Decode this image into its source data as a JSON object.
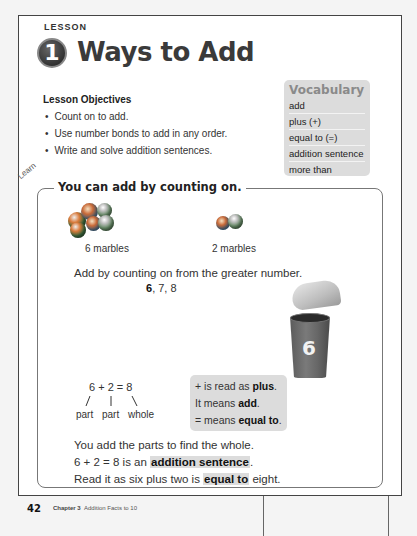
{
  "lesson": {
    "label": "LESSON",
    "number": "1",
    "title": "Ways to Add"
  },
  "objectives": {
    "heading": "Lesson Objectives",
    "items": [
      "Count on to add.",
      "Use number bonds to add in any order.",
      "Write and solve addition sentences."
    ]
  },
  "vocabulary": {
    "title": "Vocabulary",
    "items": [
      "add",
      "plus (+)",
      "equal to (=)",
      "addition sentence",
      "more than"
    ]
  },
  "learn": {
    "label": "Learn",
    "heading": "You can add by counting on.",
    "group1_caption": "6 marbles",
    "group2_caption": "2 marbles",
    "instruction": "Add by counting on from the greater number.",
    "count_start": "6",
    "count_rest": ", 7, 8",
    "cup_number": "6",
    "equation": "6 + 2 = 8",
    "bond_labels": [
      "part",
      "part",
      "whole"
    ],
    "info": {
      "line1_pre": "+ is read as ",
      "line1_bold": "plus",
      "line1_post": ".",
      "line2_pre": "It means ",
      "line2_bold": "add",
      "line2_post": ".",
      "line3_pre": "= means ",
      "line3_bold": "equal to",
      "line3_post": "."
    },
    "summary": {
      "line1": "You add the parts to find the whole.",
      "line2_pre": "6 + 2 = 8 is an ",
      "line2_bold": "addition sentence",
      "line2_post": ".",
      "line3_pre": "Read it as six plus two is ",
      "line3_bold": "equal to",
      "line3_post": " eight."
    }
  },
  "footer": {
    "page_number": "42",
    "chapter": "Chapter 3",
    "chapter_title": "Addition Facts to 10"
  },
  "colors": {
    "highlight": "#dcdcdc",
    "border": "#777777",
    "title": "#3a3a3a"
  }
}
